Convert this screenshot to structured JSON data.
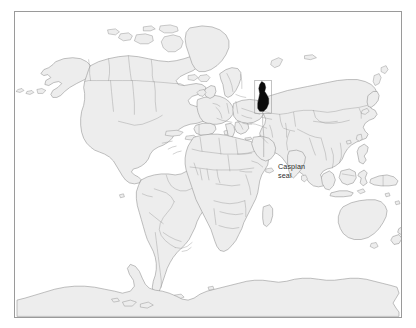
{
  "figure": {
    "kind": "world-distribution-map",
    "background_color": "#ffffff",
    "frame_color": "#9a9a9a"
  },
  "map": {
    "projection": "world",
    "land_fill_color": "#ededed",
    "coastline_color": "#8d8d8d",
    "border_color": "#9b9b9b",
    "frame": {
      "x": 14,
      "y": 11,
      "width": 388,
      "height": 307
    }
  },
  "annotations": {
    "range_marker": {
      "name": "caspian-sea-range",
      "fill_color": "#0b0b0b",
      "box_color": "#9b9b9b"
    },
    "label": {
      "line1": "Caspian",
      "line2": "seal",
      "text_color": "#2b2b2b",
      "leader_color": "#9f9f9f"
    }
  }
}
